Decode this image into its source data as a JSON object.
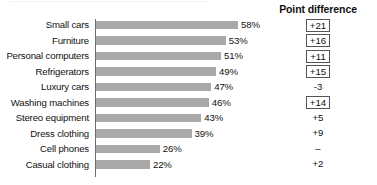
{
  "header": {
    "point_difference_label": "Point difference"
  },
  "colors": {
    "bar": "#a9a9a9",
    "axis": "#6e6e6e",
    "text": "#111111",
    "box_border": "#555555",
    "background": "#ffffff"
  },
  "chart_data": {
    "type": "bar",
    "title": "",
    "subtitle": "",
    "xlabel": "",
    "ylabel": "",
    "orientation": "horizontal",
    "grid": false,
    "legend": false,
    "xlim": [
      0,
      60
    ],
    "value_suffix": "%",
    "categories": [
      "Small cars",
      "Furniture",
      "Personal computers",
      "Refrigerators",
      "Luxury cars",
      "Washing machines",
      "Stereo equipment",
      "Dress clothing",
      "Cell phones",
      "Casual clothing"
    ],
    "values": [
      58,
      53,
      51,
      49,
      47,
      46,
      43,
      39,
      26,
      22
    ],
    "value_labels": [
      "58%",
      "53%",
      "51%",
      "49%",
      "47%",
      "46%",
      "43%",
      "39%",
      "26%",
      "22%"
    ],
    "annotations": {
      "column_title": "Point difference",
      "values": [
        "+21",
        "+16",
        "+11",
        "+15",
        "-3",
        "+14",
        "+5",
        "+9",
        "–",
        "+2"
      ],
      "boxed": [
        true,
        true,
        true,
        true,
        false,
        true,
        false,
        false,
        false,
        false
      ]
    }
  },
  "rows": [
    {
      "label": "Small cars",
      "value": 58,
      "value_label": "58%",
      "point_difference": "+21",
      "boxed": true
    },
    {
      "label": "Furniture",
      "value": 53,
      "value_label": "53%",
      "point_difference": "+16",
      "boxed": true
    },
    {
      "label": "Personal computers",
      "value": 51,
      "value_label": "51%",
      "point_difference": "+11",
      "boxed": true
    },
    {
      "label": "Refrigerators",
      "value": 49,
      "value_label": "49%",
      "point_difference": "+15",
      "boxed": true
    },
    {
      "label": "Luxury cars",
      "value": 47,
      "value_label": "47%",
      "point_difference": "-3",
      "boxed": false
    },
    {
      "label": "Washing machines",
      "value": 46,
      "value_label": "46%",
      "point_difference": "+14",
      "boxed": true
    },
    {
      "label": "Stereo equipment",
      "value": 43,
      "value_label": "43%",
      "point_difference": "+5",
      "boxed": false
    },
    {
      "label": "Dress clothing",
      "value": 39,
      "value_label": "39%",
      "point_difference": "+9",
      "boxed": false
    },
    {
      "label": "Cell phones",
      "value": 26,
      "value_label": "26%",
      "point_difference": "–",
      "boxed": false
    },
    {
      "label": "Casual clothing",
      "value": 22,
      "value_label": "22%",
      "point_difference": "+2",
      "boxed": false
    }
  ]
}
